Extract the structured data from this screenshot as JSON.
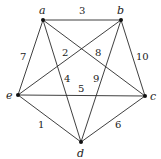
{
  "graph": {
    "nodes": [
      {
        "id": "a",
        "label": "a",
        "x": 43,
        "y": 20
      },
      {
        "id": "b",
        "label": "b",
        "x": 121,
        "y": 20
      },
      {
        "id": "c",
        "label": "c",
        "x": 145,
        "y": 96
      },
      {
        "id": "d",
        "label": "d",
        "x": 81,
        "y": 142
      },
      {
        "id": "e",
        "label": "e",
        "x": 18,
        "y": 95
      }
    ],
    "edges": [
      {
        "from": "a",
        "to": "b",
        "weight": "3"
      },
      {
        "from": "a",
        "to": "e",
        "weight": "7"
      },
      {
        "from": "a",
        "to": "d",
        "weight": "4"
      },
      {
        "from": "a",
        "to": "c",
        "weight": "8"
      },
      {
        "from": "b",
        "to": "e",
        "weight": "2"
      },
      {
        "from": "b",
        "to": "d",
        "weight": "9"
      },
      {
        "from": "b",
        "to": "c",
        "weight": "10"
      },
      {
        "from": "e",
        "to": "c",
        "weight": "5"
      },
      {
        "from": "e",
        "to": "d",
        "weight": "1"
      },
      {
        "from": "d",
        "to": "c",
        "weight": "6"
      }
    ]
  }
}
